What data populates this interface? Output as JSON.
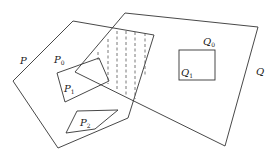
{
  "diagram": {
    "type": "geometric-polygons",
    "labels": {
      "P": "P",
      "P0": {
        "base": "P",
        "sub": "0"
      },
      "P1": {
        "base": "P",
        "sub": "1"
      },
      "P2": {
        "base": "P",
        "sub": "2"
      },
      "Q": "Q",
      "Q0": {
        "base": "Q",
        "sub": "0"
      },
      "Q1": {
        "base": "Q",
        "sub": "1"
      }
    },
    "shapes": [
      {
        "name": "P",
        "kind": "outer-polygon"
      },
      {
        "name": "P1",
        "kind": "hole-polygon",
        "inside": "P"
      },
      {
        "name": "P2",
        "kind": "hole-polygon",
        "inside": "P"
      },
      {
        "name": "Q",
        "kind": "outer-polygon"
      },
      {
        "name": "Q1",
        "kind": "hole-rectangle",
        "inside": "Q"
      },
      {
        "name": "intersection",
        "kind": "hatched-region",
        "description": "overlap of P and Q shaded with vertical dashed lines"
      }
    ]
  }
}
